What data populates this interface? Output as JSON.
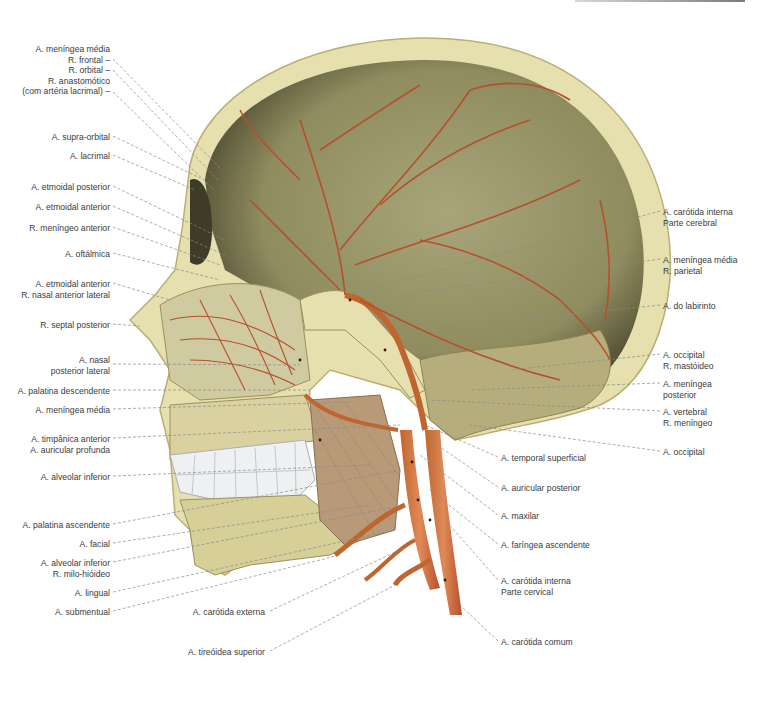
{
  "figure": {
    "labels_left": [
      {
        "lines": [
          "A. meníngea média",
          "R. frontal –",
          "R. orbital –",
          "R. anastomótico",
          "(com artéria lacrimal) –"
        ],
        "x": 110,
        "y": 44
      },
      {
        "lines": [
          "A. supra-orbital"
        ],
        "x": 110,
        "y": 132
      },
      {
        "lines": [
          "A. lacrimal"
        ],
        "x": 110,
        "y": 151
      },
      {
        "lines": [
          "A. etmoidal posterior"
        ],
        "x": 110,
        "y": 182
      },
      {
        "lines": [
          "A. etmoidal anterior"
        ],
        "x": 110,
        "y": 202
      },
      {
        "lines": [
          "R. meníngeo anterior"
        ],
        "x": 110,
        "y": 223
      },
      {
        "lines": [
          "A. oftálmica"
        ],
        "x": 110,
        "y": 249
      },
      {
        "lines": [
          "A. etmoidal anterior",
          "R. nasal anterior lateral"
        ],
        "x": 110,
        "y": 279
      },
      {
        "lines": [
          "R. septal posterior"
        ],
        "x": 110,
        "y": 320
      },
      {
        "lines": [
          "A. nasal",
          "posterior lateral"
        ],
        "x": 110,
        "y": 355
      },
      {
        "lines": [
          "A. palatina descendente"
        ],
        "x": 110,
        "y": 386
      },
      {
        "lines": [
          "A. meníngea média"
        ],
        "x": 110,
        "y": 405
      },
      {
        "lines": [
          "A. timpânica anterior",
          "A. auricular profunda"
        ],
        "x": 110,
        "y": 434
      },
      {
        "lines": [
          "A. alveolar inferior"
        ],
        "x": 110,
        "y": 472
      },
      {
        "lines": [
          "A. palatina ascendente"
        ],
        "x": 110,
        "y": 520
      },
      {
        "lines": [
          "A. facial"
        ],
        "x": 110,
        "y": 539
      },
      {
        "lines": [
          "A. alveolar inferior",
          "R. milo-hióideo"
        ],
        "x": 110,
        "y": 558
      },
      {
        "lines": [
          "A. lingual"
        ],
        "x": 110,
        "y": 588
      },
      {
        "lines": [
          "A. submentual"
        ],
        "x": 110,
        "y": 607
      }
    ],
    "labels_bottom": [
      {
        "lines": [
          "A. carótida externa"
        ],
        "x": 265,
        "y": 607
      },
      {
        "lines": [
          "A. tireóidea superior"
        ],
        "x": 265,
        "y": 647
      }
    ],
    "labels_right": [
      {
        "lines": [
          "A. carótida interna",
          "Parte cerebral"
        ],
        "x": 663,
        "y": 207
      },
      {
        "lines": [
          "A. meníngea média",
          "R. parietal"
        ],
        "x": 663,
        "y": 255
      },
      {
        "lines": [
          "A. do labirinto"
        ],
        "x": 663,
        "y": 301
      },
      {
        "lines": [
          "A. occipital",
          "R. mastóideo"
        ],
        "x": 663,
        "y": 350
      },
      {
        "lines": [
          "A. meníngea",
          "posterior"
        ],
        "x": 663,
        "y": 379
      },
      {
        "lines": [
          "A. vertebral",
          "R. meníngeo"
        ],
        "x": 663,
        "y": 407
      },
      {
        "lines": [
          "A. occipital"
        ],
        "x": 663,
        "y": 447
      },
      {
        "lines": [
          "A. temporal superficial"
        ],
        "x": 501,
        "y": 453
      },
      {
        "lines": [
          "A. auricular posterior"
        ],
        "x": 501,
        "y": 483
      },
      {
        "lines": [
          "A. maxilar"
        ],
        "x": 501,
        "y": 511
      },
      {
        "lines": [
          "A. faríngea ascendente"
        ],
        "x": 501,
        "y": 540
      },
      {
        "lines": [
          "A. carótida interna",
          "Parte cervical"
        ],
        "x": 501,
        "y": 576
      },
      {
        "lines": [
          "A. carótida comum"
        ],
        "x": 501,
        "y": 637
      }
    ]
  },
  "colors": {
    "bone": "#e6dfae",
    "bone_edge": "#b9ae74",
    "cavity": "#8e8a5e",
    "cavity_dark": "#4a4730",
    "artery": "#b5502e",
    "artery_light": "#d88a5e",
    "muscle": "#b89a78",
    "teeth": "#eef0f2",
    "leader_line": "#8a8a8a"
  }
}
